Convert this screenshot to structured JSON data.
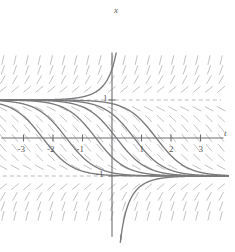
{
  "figure": {
    "name": "slope-field-with-solution-curves",
    "axis_labels": {
      "x_axis": "t",
      "y_axis": "x"
    },
    "colors": {
      "axis": "#6d6e71",
      "curve": "#7a7a7c",
      "slope_mark": "#b9bbbd",
      "asymptote": "#a7a9ac",
      "text": "#58595b",
      "background": "#ffffff"
    }
  },
  "chart_data": {
    "type": "line",
    "title": "",
    "subtitle": "",
    "xlabel": "t",
    "ylabel": "x",
    "xlim": [
      -3.8,
      3.8
    ],
    "ylim": [
      -2.1,
      2.1
    ],
    "grid": false,
    "legend_position": "none",
    "x_ticks": [
      -3,
      -2,
      -1,
      1,
      2,
      3
    ],
    "x_tick_labels": [
      "-3",
      "-2",
      "-1",
      "1",
      "2",
      "3"
    ],
    "y_ticks": [
      1,
      -1
    ],
    "y_tick_labels": [
      "1",
      "-1"
    ],
    "slope_field": {
      "description": "direction field of dx/dt = x^2 - 1",
      "equation": "dx/dt = x^2 - 1",
      "x_range": [
        -3.7,
        3.7
      ],
      "y_range": [
        -2.05,
        2.05
      ],
      "nx": 19,
      "ny": 17,
      "mark_length": 9
    },
    "equilibria": [
      {
        "value": 1,
        "label": "1",
        "style": "dashed",
        "stability": "unstable"
      },
      {
        "value": -1,
        "label": "-1",
        "style": "dashed",
        "stability": "stable"
      }
    ],
    "series": [
      {
        "name": "solution-curve-1",
        "t0": -2.35,
        "branch": "middle"
      },
      {
        "name": "solution-curve-2",
        "t0": -1.55,
        "branch": "middle"
      },
      {
        "name": "solution-curve-3",
        "t0": -0.55,
        "branch": "middle"
      },
      {
        "name": "solution-curve-4",
        "t0": 0.15,
        "branch": "middle"
      },
      {
        "name": "solution-curve-5",
        "t0": 0.75,
        "branch": "middle"
      },
      {
        "name": "solution-curve-6",
        "t0": 1.5,
        "branch": "middle"
      },
      {
        "name": "solution-curve-upper",
        "t0": 0.62,
        "branch": "upper"
      },
      {
        "name": "solution-curve-lower",
        "t0": -0.1,
        "branch": "lower"
      }
    ]
  }
}
